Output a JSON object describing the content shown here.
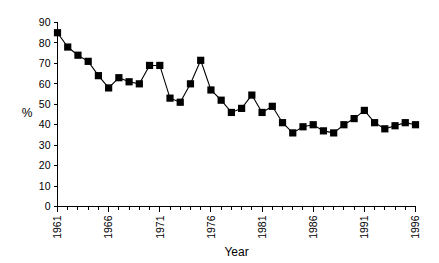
{
  "chart_data": {
    "type": "line",
    "title": "",
    "subtitle": "",
    "xlabel": "Year",
    "ylabel": "%",
    "xlim": [
      1960.5,
      1996.5
    ],
    "ylim": [
      0,
      90
    ],
    "grid": false,
    "legend": null,
    "y_ticks": [
      0,
      10,
      20,
      30,
      40,
      50,
      60,
      70,
      80,
      90
    ],
    "y_tick_labels": [
      "0",
      "10",
      "20",
      "30",
      "40",
      "50",
      "60",
      "70",
      "80",
      "90"
    ],
    "x_ticks": [
      1961,
      1966,
      1971,
      1976,
      1981,
      1986,
      1991,
      1996
    ],
    "x_tick_labels": [
      "1961",
      "1966",
      "1971",
      "1976",
      "1981",
      "1986",
      "1991",
      "1996"
    ],
    "x_minor_ticks_every": 1,
    "marker": "filled-square",
    "series": [
      {
        "name": "",
        "color": "#000000",
        "x": [
          1961,
          1962,
          1963,
          1964,
          1965,
          1966,
          1967,
          1968,
          1969,
          1970,
          1971,
          1972,
          1973,
          1974,
          1975,
          1976,
          1977,
          1978,
          1979,
          1980,
          1981,
          1982,
          1983,
          1984,
          1985,
          1986,
          1987,
          1988,
          1989,
          1990,
          1991,
          1992,
          1993,
          1994,
          1995,
          1996
        ],
        "values": [
          85,
          78,
          74,
          71,
          64,
          58,
          63,
          61,
          60,
          69,
          69,
          53,
          51,
          60,
          71.5,
          57,
          52,
          46,
          48,
          54.5,
          46,
          49,
          41,
          36,
          39,
          40,
          37,
          36,
          40,
          43,
          47,
          41,
          38,
          39.5,
          41,
          40
        ]
      }
    ]
  },
  "axis": {
    "y_title": "%",
    "x_title": "Year"
  }
}
